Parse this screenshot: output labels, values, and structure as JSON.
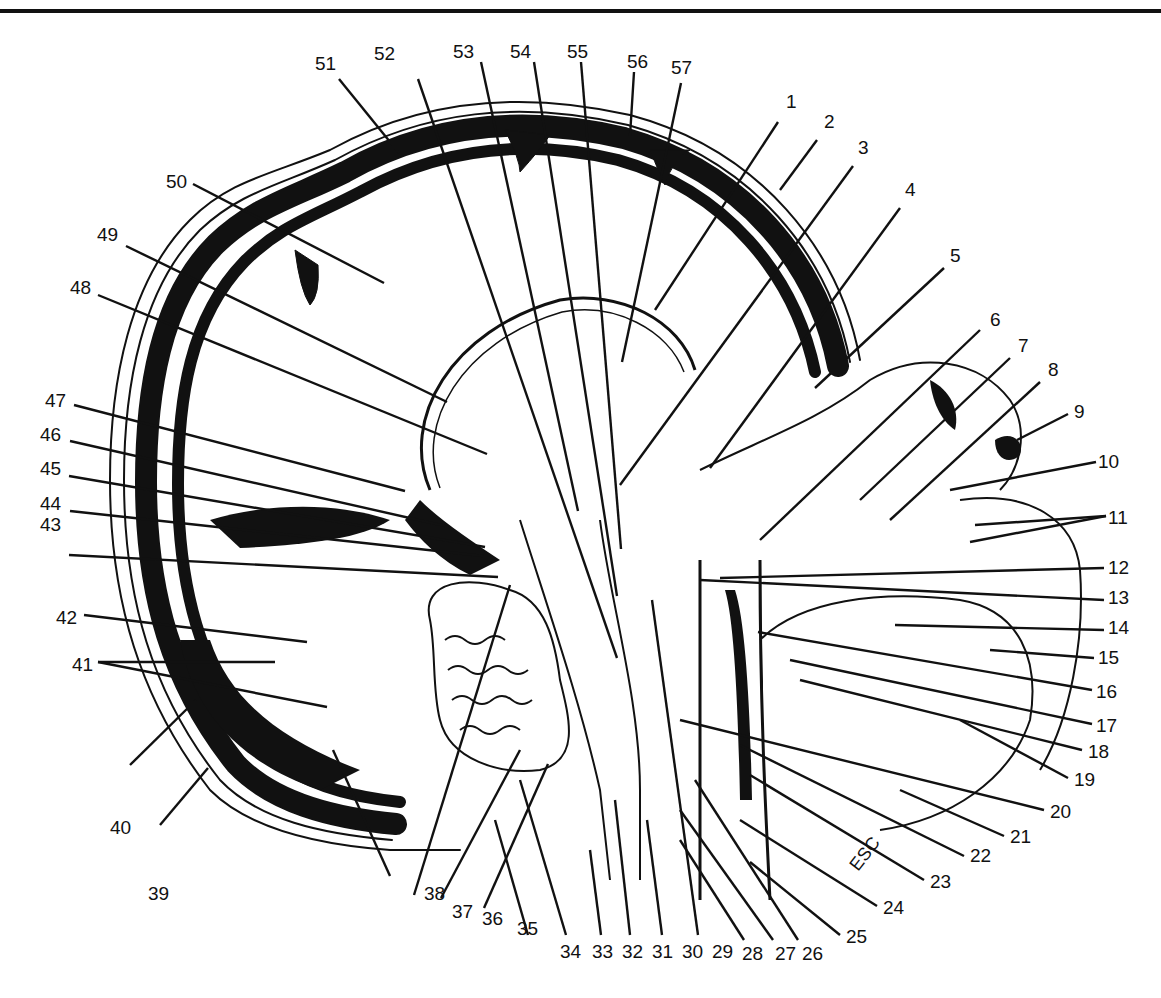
{
  "figure": {
    "type": "anatomical sagittal section of head (median plane)",
    "annotation_text": "ESC",
    "colors": {
      "ink": "#111111",
      "paper": "#ffffff"
    }
  },
  "labels": [
    {
      "n": "1",
      "x": 786,
      "y": 108,
      "lx1": 778,
      "ly1": 122,
      "lx2": 655,
      "ly2": 310
    },
    {
      "n": "2",
      "x": 824,
      "y": 128,
      "lx1": 817,
      "ly1": 140,
      "lx2": 780,
      "ly2": 190
    },
    {
      "n": "3",
      "x": 858,
      "y": 154,
      "lx1": 853,
      "ly1": 166,
      "lx2": 620,
      "ly2": 485
    },
    {
      "n": "4",
      "x": 905,
      "y": 196,
      "lx1": 900,
      "ly1": 208,
      "lx2": 710,
      "ly2": 468
    },
    {
      "n": "5",
      "x": 950,
      "y": 262,
      "lx1": 944,
      "ly1": 268,
      "lx2": 815,
      "ly2": 388
    },
    {
      "n": "6",
      "x": 990,
      "y": 326,
      "lx1": 980,
      "ly1": 330,
      "lx2": 760,
      "ly2": 540
    },
    {
      "n": "7",
      "x": 1018,
      "y": 352,
      "lx1": 1010,
      "ly1": 358,
      "lx2": 860,
      "ly2": 500
    },
    {
      "n": "8",
      "x": 1048,
      "y": 376,
      "lx1": 1040,
      "ly1": 382,
      "lx2": 890,
      "ly2": 520
    },
    {
      "n": "9",
      "x": 1074,
      "y": 418,
      "lx1": 1068,
      "ly1": 414,
      "lx2": 1017,
      "ly2": 440
    },
    {
      "n": "10",
      "x": 1098,
      "y": 468,
      "lx1": 1096,
      "ly1": 462,
      "lx2": 950,
      "ly2": 490
    },
    {
      "n": "11",
      "x": 1108,
      "y": 524,
      "lx1": 1106,
      "ly1": 516,
      "lx2": 975,
      "ly2": 525,
      "lx3": 1106,
      "ly3": 516,
      "lx4": 970,
      "ly4": 542
    },
    {
      "n": "12",
      "x": 1108,
      "y": 574,
      "lx1": 1104,
      "ly1": 568,
      "lx2": 720,
      "ly2": 578
    },
    {
      "n": "13",
      "x": 1108,
      "y": 604,
      "lx1": 1104,
      "ly1": 600,
      "lx2": 700,
      "ly2": 580
    },
    {
      "n": "14",
      "x": 1108,
      "y": 634,
      "lx1": 1104,
      "ly1": 630,
      "lx2": 895,
      "ly2": 625
    },
    {
      "n": "15",
      "x": 1098,
      "y": 664,
      "lx1": 1094,
      "ly1": 658,
      "lx2": 990,
      "ly2": 650
    },
    {
      "n": "16",
      "x": 1096,
      "y": 698,
      "lx1": 1092,
      "ly1": 690,
      "lx2": 758,
      "ly2": 632
    },
    {
      "n": "17",
      "x": 1096,
      "y": 732,
      "lx1": 1092,
      "ly1": 724,
      "lx2": 790,
      "ly2": 660
    },
    {
      "n": "18",
      "x": 1088,
      "y": 758,
      "lx1": 1082,
      "ly1": 750,
      "lx2": 800,
      "ly2": 680
    },
    {
      "n": "19",
      "x": 1074,
      "y": 786,
      "lx1": 1068,
      "ly1": 778,
      "lx2": 960,
      "ly2": 720
    },
    {
      "n": "20",
      "x": 1050,
      "y": 818,
      "lx1": 1044,
      "ly1": 810,
      "lx2": 680,
      "ly2": 720
    },
    {
      "n": "21",
      "x": 1010,
      "y": 843,
      "lx1": 1004,
      "ly1": 836,
      "lx2": 900,
      "ly2": 790
    },
    {
      "n": "22",
      "x": 970,
      "y": 862,
      "lx1": 964,
      "ly1": 856,
      "lx2": 740,
      "ly2": 745
    },
    {
      "n": "23",
      "x": 930,
      "y": 888,
      "lx1": 924,
      "ly1": 880,
      "lx2": 750,
      "ly2": 775
    },
    {
      "n": "24",
      "x": 883,
      "y": 914,
      "lx1": 877,
      "ly1": 906,
      "lx2": 740,
      "ly2": 820
    },
    {
      "n": "25",
      "x": 846,
      "y": 943,
      "lx1": 840,
      "ly1": 935,
      "lx2": 750,
      "ly2": 862
    },
    {
      "n": "26",
      "x": 802,
      "y": 960,
      "lx1": 798,
      "ly1": 940,
      "lx2": 695,
      "ly2": 780
    },
    {
      "n": "27",
      "x": 775,
      "y": 960,
      "lx1": 773,
      "ly1": 940,
      "lx2": 680,
      "ly2": 810
    },
    {
      "n": "28",
      "x": 742,
      "y": 960,
      "lx1": 744,
      "ly1": 940,
      "lx2": 680,
      "ly2": 840
    },
    {
      "n": "29",
      "x": 712,
      "y": 958,
      "lx1": 698,
      "ly1": 935,
      "lx2": 652,
      "ly2": 600
    },
    {
      "n": "30",
      "x": 682,
      "y": 958,
      "lx1": 662,
      "ly1": 935,
      "lx2": 647,
      "ly2": 820
    },
    {
      "n": "31",
      "x": 652,
      "y": 958,
      "lx1": 630,
      "ly1": 935,
      "lx2": 615,
      "ly2": 800
    },
    {
      "n": "32",
      "x": 622,
      "y": 958,
      "lx1": 601,
      "ly1": 935,
      "lx2": 590,
      "ly2": 850
    },
    {
      "n": "33",
      "x": 592,
      "y": 958,
      "lx1": 566,
      "ly1": 935,
      "lx2": 520,
      "ly2": 780
    },
    {
      "n": "34",
      "x": 560,
      "y": 958,
      "lx1": 528,
      "ly1": 935,
      "lx2": 495,
      "ly2": 820
    },
    {
      "n": "35",
      "x": 517,
      "y": 935,
      "lx1": 484,
      "ly1": 908,
      "lx2": 548,
      "ly2": 764
    },
    {
      "n": "36",
      "x": 482,
      "y": 925,
      "lx1": 441,
      "ly1": 898,
      "lx2": 520,
      "ly2": 750
    },
    {
      "n": "37",
      "x": 452,
      "y": 918,
      "lx1": 414,
      "ly1": 895,
      "lx2": 510,
      "ly2": 585
    },
    {
      "n": "38",
      "x": 424,
      "y": 900,
      "lx1": 390,
      "ly1": 876,
      "lx2": 333,
      "ly2": 750
    },
    {
      "n": "39",
      "x": 148,
      "y": 900,
      "lx1": 160,
      "ly1": 825,
      "lx2": 208,
      "ly2": 768
    },
    {
      "n": "40",
      "x": 110,
      "y": 834,
      "lx1": 130,
      "ly1": 765,
      "lx2": 196,
      "ly2": 700
    },
    {
      "n": "41",
      "x": 72,
      "y": 671,
      "lx1": 98,
      "ly1": 662,
      "lx2": 275,
      "ly2": 662,
      "lx3": 98,
      "ly3": 662,
      "lx4": 327,
      "ly4": 707
    },
    {
      "n": "42",
      "x": 56,
      "y": 624,
      "lx1": 84,
      "ly1": 615,
      "lx2": 307,
      "ly2": 642
    },
    {
      "n": "43",
      "x": 40,
      "y": 531,
      "lx1": 69,
      "ly1": 555,
      "lx2": 498,
      "ly2": 577
    },
    {
      "n": "44",
      "x": 40,
      "y": 510,
      "lx1": 70,
      "ly1": 511,
      "lx2": 483,
      "ly2": 556
    },
    {
      "n": "45",
      "x": 40,
      "y": 475,
      "lx1": 69,
      "ly1": 476,
      "lx2": 485,
      "ly2": 547
    },
    {
      "n": "46",
      "x": 40,
      "y": 441,
      "lx1": 70,
      "ly1": 441,
      "lx2": 445,
      "ly2": 526
    },
    {
      "n": "47",
      "x": 45,
      "y": 407,
      "lx1": 74,
      "ly1": 405,
      "lx2": 405,
      "ly2": 491
    },
    {
      "n": "48",
      "x": 70,
      "y": 294,
      "lx1": 98,
      "ly1": 295,
      "lx2": 487,
      "ly2": 454
    },
    {
      "n": "49",
      "x": 97,
      "y": 241,
      "lx1": 126,
      "ly1": 246,
      "lx2": 447,
      "ly2": 402
    },
    {
      "n": "50",
      "x": 166,
      "y": 188,
      "lx1": 193,
      "ly1": 184,
      "lx2": 384,
      "ly2": 283
    },
    {
      "n": "51",
      "x": 315,
      "y": 70,
      "lx1": 339,
      "ly1": 79,
      "lx2": 399,
      "ly2": 153
    },
    {
      "n": "52",
      "x": 374,
      "y": 60,
      "lx1": 418,
      "ly1": 79,
      "lx2": 617,
      "ly2": 658
    },
    {
      "n": "53",
      "x": 453,
      "y": 58,
      "lx1": 481,
      "ly1": 62,
      "lx2": 578,
      "ly2": 511
    },
    {
      "n": "54",
      "x": 510,
      "y": 58,
      "lx1": 534,
      "ly1": 62,
      "lx2": 617,
      "ly2": 596
    },
    {
      "n": "55",
      "x": 567,
      "y": 58,
      "lx1": 581,
      "ly1": 62,
      "lx2": 621,
      "ly2": 549
    },
    {
      "n": "56",
      "x": 627,
      "y": 68,
      "lx1": 634,
      "ly1": 72,
      "lx2": 630,
      "ly2": 136
    },
    {
      "n": "57",
      "x": 671,
      "y": 74,
      "lx1": 681,
      "ly1": 83,
      "lx2": 622,
      "ly2": 362
    }
  ]
}
